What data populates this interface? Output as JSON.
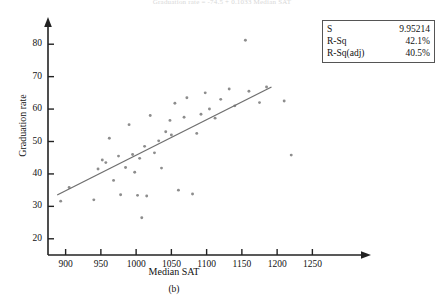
{
  "figure": {
    "faint_title": "Graduation rate  =  -74.5  +  0.1033 Median SAT",
    "caption": "(b)"
  },
  "stats_box": {
    "rows": [
      {
        "key": "S",
        "value": "9.95214"
      },
      {
        "key": "R-Sq",
        "value": "42.1%"
      },
      {
        "key": "R-Sq(adj)",
        "value": "40.5%"
      }
    ]
  },
  "chart_data": {
    "type": "scatter",
    "title": "",
    "xlabel": "Median SAT",
    "ylabel": "Graduation rate",
    "xlim": [
      875,
      1275
    ],
    "ylim": [
      15,
      85
    ],
    "xticks": [
      900,
      950,
      1000,
      1050,
      1100,
      1150,
      1200,
      1250
    ],
    "yticks": [
      20,
      30,
      40,
      50,
      60,
      70,
      80
    ],
    "grid": false,
    "legend": "none",
    "marker_color": "#8d8d8d",
    "line_color": "#6f6f6f",
    "fit_line": {
      "label": "regression line",
      "x_start": 888,
      "y_start": 33.5,
      "x_end": 1192,
      "y_end": 66.8
    },
    "points": [
      {
        "x": 893,
        "y": 31.6
      },
      {
        "x": 905,
        "y": 35.8
      },
      {
        "x": 940,
        "y": 32.0
      },
      {
        "x": 946,
        "y": 41.5
      },
      {
        "x": 952,
        "y": 44.3
      },
      {
        "x": 957,
        "y": 43.5
      },
      {
        "x": 962,
        "y": 51.0
      },
      {
        "x": 968,
        "y": 38.0
      },
      {
        "x": 975,
        "y": 45.5
      },
      {
        "x": 978,
        "y": 33.6
      },
      {
        "x": 985,
        "y": 42.0
      },
      {
        "x": 990,
        "y": 55.2
      },
      {
        "x": 995,
        "y": 46.0
      },
      {
        "x": 998,
        "y": 40.5
      },
      {
        "x": 1002,
        "y": 33.4
      },
      {
        "x": 1005,
        "y": 44.8
      },
      {
        "x": 1008,
        "y": 26.5
      },
      {
        "x": 1012,
        "y": 48.5
      },
      {
        "x": 1015,
        "y": 33.2
      },
      {
        "x": 1020,
        "y": 58.0
      },
      {
        "x": 1026,
        "y": 46.5
      },
      {
        "x": 1032,
        "y": 50.2
      },
      {
        "x": 1036,
        "y": 41.8
      },
      {
        "x": 1042,
        "y": 53.0
      },
      {
        "x": 1048,
        "y": 56.5
      },
      {
        "x": 1050,
        "y": 52.0
      },
      {
        "x": 1055,
        "y": 61.8
      },
      {
        "x": 1060,
        "y": 35.0
      },
      {
        "x": 1068,
        "y": 57.5
      },
      {
        "x": 1072,
        "y": 63.5
      },
      {
        "x": 1080,
        "y": 33.8
      },
      {
        "x": 1086,
        "y": 52.5
      },
      {
        "x": 1092,
        "y": 58.4
      },
      {
        "x": 1098,
        "y": 65.0
      },
      {
        "x": 1104,
        "y": 60.0
      },
      {
        "x": 1112,
        "y": 57.2
      },
      {
        "x": 1120,
        "y": 63.0
      },
      {
        "x": 1132,
        "y": 66.2
      },
      {
        "x": 1140,
        "y": 61.0
      },
      {
        "x": 1155,
        "y": 81.2
      },
      {
        "x": 1160,
        "y": 65.5
      },
      {
        "x": 1175,
        "y": 62.0
      },
      {
        "x": 1185,
        "y": 66.8
      },
      {
        "x": 1210,
        "y": 62.5
      },
      {
        "x": 1220,
        "y": 45.8
      }
    ]
  }
}
